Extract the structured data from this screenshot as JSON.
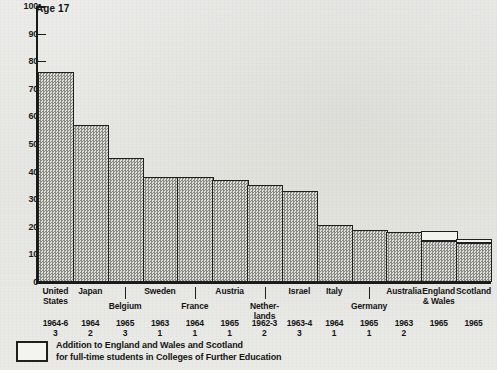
{
  "chart": {
    "title": "Age 17",
    "legend": {
      "swatch_name": "addition-swatch",
      "line1": "Addition to England and Wales and Scotland",
      "line2": "for full-time students in Colleges of Further Education"
    }
  },
  "chart_data": {
    "type": "bar",
    "title": "Age 17",
    "xlabel": "",
    "ylabel": "",
    "ylim": [
      0,
      100
    ],
    "yticks": [
      0,
      10,
      20,
      30,
      40,
      50,
      60,
      70,
      80,
      90,
      100
    ],
    "grid": false,
    "legend_position": "below-axis",
    "categories": [
      "United States",
      "Japan",
      "Belgium",
      "Sweden",
      "France",
      "Austria",
      "Netherlands",
      "Israel",
      "Italy",
      "Germany",
      "Australia",
      "England & Wales",
      "Scotland"
    ],
    "category_labels": [
      "United\nStates",
      "Japan",
      "Belgium",
      "Sweden",
      "France",
      "Austria",
      "Nether-\nlands",
      "Israel",
      "Italy",
      "Germany",
      "Australia",
      "England\n& Wales",
      "Scotland"
    ],
    "years": [
      "1964-6",
      "1964",
      "1965",
      "1963",
      "1964",
      "1965",
      "1962-3",
      "1963-4",
      "1964",
      "1965",
      "1963",
      "1965",
      "1965"
    ],
    "notes": [
      "3",
      "2",
      "3",
      "1",
      "1",
      "1",
      "2",
      "3",
      "1",
      "1",
      "2",
      "",
      ""
    ],
    "series": [
      {
        "name": "Percentage in full-time education",
        "values": [
          76,
          57,
          45,
          38,
          38,
          37,
          35,
          33,
          20.5,
          19,
          18,
          15,
          14
        ]
      },
      {
        "name": "Addition for full-time students in Colleges of Further Education",
        "values": [
          0,
          0,
          0,
          0,
          0,
          0,
          0,
          0,
          0,
          0,
          0,
          3.5,
          1.5
        ]
      }
    ]
  }
}
